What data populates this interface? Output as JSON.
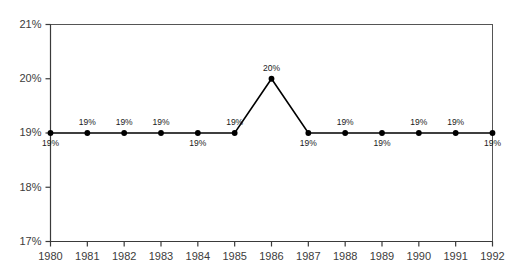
{
  "chart_data": {
    "type": "line",
    "title": "",
    "subtitle": "",
    "xlabel": "",
    "ylabel": "",
    "grid": false,
    "legend": false,
    "categories": [
      "1980",
      "1981",
      "1982",
      "1983",
      "1984",
      "1985",
      "1986",
      "1987",
      "1988",
      "1989",
      "1990",
      "1991",
      "1992"
    ],
    "values": [
      19,
      19,
      19,
      19,
      19,
      19,
      20,
      19,
      19,
      19,
      19,
      19,
      19
    ],
    "point_labels": [
      "19%",
      "19%",
      "19%",
      "19%",
      "19%",
      "19%",
      "20%",
      "19%",
      "19%",
      "19%",
      "19%",
      "19%",
      "19%"
    ],
    "point_label_positions": [
      "below",
      "above",
      "above",
      "above",
      "below",
      "above",
      "above",
      "below",
      "above",
      "below",
      "above",
      "above",
      "below"
    ],
    "ylim": [
      17,
      21
    ],
    "ytick_values": [
      17,
      18,
      19,
      20,
      21
    ],
    "ytick_labels": [
      "17%",
      "18%",
      "19%",
      "20%",
      "21%"
    ],
    "xtick_labels": [
      "1980",
      "1981",
      "1982",
      "1983",
      "1984",
      "1985",
      "1986",
      "1987",
      "1988",
      "1989",
      "1990",
      "1991",
      "1992"
    ],
    "series": [
      {
        "name": "",
        "values": [
          19,
          19,
          19,
          19,
          19,
          19,
          20,
          19,
          19,
          19,
          19,
          19,
          19
        ]
      }
    ],
    "colors": {
      "line": "#000000",
      "marker": "#000000",
      "axis": "#3a3a3a",
      "border": "#555555",
      "tick_text": "#3c3c3c",
      "label_text": "#1a1a1a",
      "background": "#ffffff"
    }
  }
}
